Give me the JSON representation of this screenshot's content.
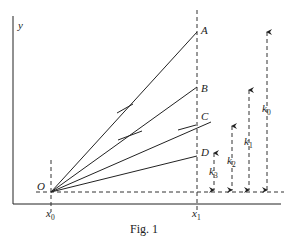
{
  "figure": {
    "caption": "Fig. 1",
    "axes": {
      "y_label": "y",
      "origin_label": "O",
      "x0_label": "x",
      "x0_sub": "0",
      "x1_label": "x",
      "x1_sub": "1"
    },
    "points": [
      {
        "label": "A"
      },
      {
        "label": "B"
      },
      {
        "label": "C"
      },
      {
        "label": "D"
      }
    ],
    "arrows": [
      {
        "label": "k",
        "sub": "3"
      },
      {
        "label": "k",
        "sub": "2"
      },
      {
        "label": "k",
        "sub": "1"
      },
      {
        "label": "k",
        "sub": "0"
      }
    ]
  }
}
